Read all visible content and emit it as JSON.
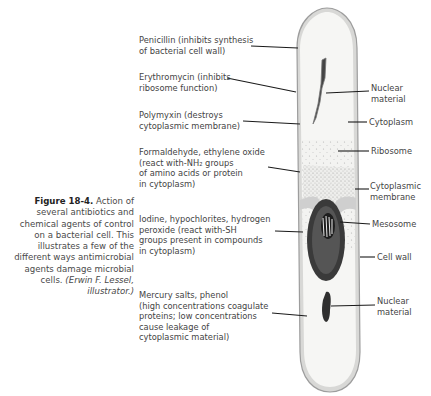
{
  "caption": {
    "figure_label": "Figure 18-4.",
    "text": "Action of several antibiotics and chemical agents of control on a bacterial cell. This illustrates a few of the different ways antimicrobial agents damage microbial cells.",
    "lines": [
      "several antibiotics and",
      "chemical agents of control",
      "on a bacterial cell. This",
      "illustrates a few of the",
      "different ways antimicrobial",
      "agents damage microbial"
    ],
    "first_line_rest": " Action of",
    "last_line_plain": "cells. ",
    "credit_line1": "(Erwin F. Lessel,",
    "credit_line2": "illustrator.)"
  },
  "left_labels": [
    {
      "lines": [
        "Penicillin (inhibits synthesis",
        "of bacterial cell wall)"
      ]
    },
    {
      "lines": [
        "Erythromycin (inhibits",
        "ribosome function)"
      ]
    },
    {
      "lines": [
        "Polymyxin (destroys",
        "cytoplasmic membrane)"
      ]
    },
    {
      "lines": [
        "Formaldehyde, ethylene oxide",
        "(react with-NH₂ groups",
        "of amino acids or protein",
        "in cytoplasm)"
      ]
    },
    {
      "lines": [
        "Iodine, hypochlorites, hydrogen",
        "peroxide (react with-SH",
        "groups present in compounds",
        "in cytoplasm)"
      ]
    },
    {
      "lines": [
        "Mercury salts, phenol",
        "(high concentrations coagulate",
        "proteins; low concentrations",
        "cause leakage of",
        "cytoplasmic material)"
      ]
    }
  ],
  "right_labels": [
    {
      "lines": [
        "Nuclear",
        "material"
      ]
    },
    {
      "lines": [
        "Cytoplasm"
      ]
    },
    {
      "lines": [
        "Ribosome"
      ]
    },
    {
      "lines": [
        "Cytoplasmic",
        "membrane"
      ]
    },
    {
      "lines": [
        "Mesosome"
      ]
    },
    {
      "lines": [
        "Cell wall"
      ]
    },
    {
      "lines": [
        "Nuclear",
        "material"
      ]
    }
  ],
  "colors": {
    "cell_wall": "#b9b9b9",
    "cytoplasm": "#f2f2f0",
    "membrane_fill": "#dcdcdc",
    "mesosome": "#2e2e2e",
    "leader_line": "#1a1a1a",
    "text": "#444444"
  }
}
